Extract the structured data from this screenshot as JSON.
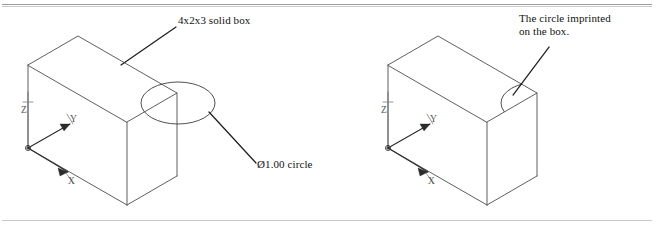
{
  "figure": {
    "background_color": "#ffffff",
    "line_color": "#4d4d4d",
    "text_color": "#111111",
    "width": 657,
    "height": 236
  },
  "rules": {
    "top_rule_label": "top-horizontal-rule",
    "bottom_rule_label": "bottom-horizontal-rule"
  },
  "left_view": {
    "name": "box-with-circle-overlay",
    "box_label": "4x2x3 solid box",
    "circle_label": "Ø1.00 circle",
    "box_dimensions": "4x2x3",
    "circle_diameter": "Ø1.00",
    "ucs": {
      "x_label": "X",
      "y_label": "Y",
      "z_label": "Z"
    }
  },
  "right_view": {
    "name": "box-with-imprinted-circle",
    "imprint_label": "The circle imprinted\non the box.",
    "ucs": {
      "x_label": "X",
      "y_label": "Y",
      "z_label": "Z"
    }
  }
}
